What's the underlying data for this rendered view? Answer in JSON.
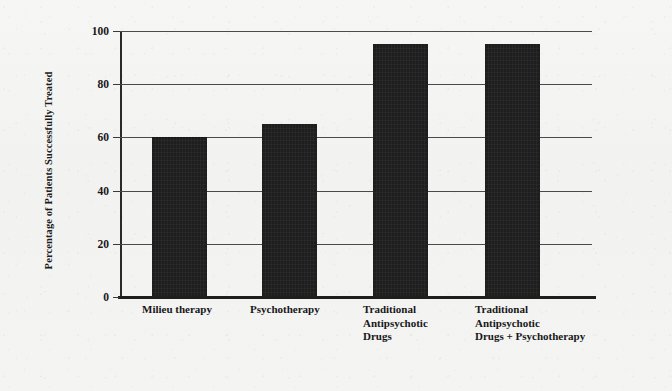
{
  "chart_data": {
    "type": "bar",
    "title": "",
    "subtitle": "",
    "xlabel": "",
    "ylabel": "Percentage of Patients Successfully Treated",
    "categories": [
      "Milieu therapy",
      "Psychotherapy",
      "Traditional\nAntipsychotic\nDrugs",
      "Traditional\nAntipsychotic\nDrugs + Psychotherapy"
    ],
    "values": [
      60,
      65,
      95,
      95
    ],
    "ylim": [
      0,
      100
    ],
    "yticks": [
      0,
      20,
      40,
      60,
      80,
      100
    ],
    "ytick_labels": [
      "0",
      "20",
      "40",
      "60",
      "80",
      "100"
    ],
    "grid": true,
    "grid_axis": "y",
    "legend": false,
    "legend_position": "none",
    "annotations": [],
    "colors": {
      "bar_fill": "#1e1e1e",
      "gridline": "#4a4a4a",
      "axis": "#1e1e1e",
      "text": "#17171a",
      "background": "#f4f4f2"
    }
  }
}
